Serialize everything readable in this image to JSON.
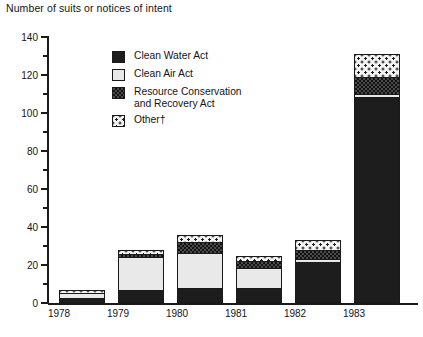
{
  "chart_data": {
    "type": "bar",
    "stacked": true,
    "title": "Number of suits or notices of intent",
    "xlabel": "",
    "ylabel": "Number of suits or notices of intent",
    "ylim": [
      0,
      140
    ],
    "ytick_step": 20,
    "yminor_step": 10,
    "grid": false,
    "legend_position": "inside-upper-left",
    "categories": [
      "1978",
      "1979",
      "1980",
      "1981",
      "1982",
      "1983"
    ],
    "yticks": [
      "0",
      "20",
      "40",
      "60",
      "80",
      "100",
      "120",
      "140"
    ],
    "series": [
      {
        "name": "Clean Water Act",
        "pattern": "solid-black",
        "values": [
          2,
          6,
          7,
          7,
          21,
          108
        ]
      },
      {
        "name": "Clean Air Act",
        "pattern": "light-stipple",
        "values": [
          3,
          18,
          19,
          11,
          2,
          2
        ]
      },
      {
        "name": "Resource Conservation\nand Recovery Act",
        "pattern": "dense-checker",
        "values": [
          0,
          1.5,
          6,
          4,
          5,
          9
        ]
      },
      {
        "name": "Other†",
        "pattern": "open-dots",
        "values": [
          2,
          2.5,
          4,
          3,
          5,
          12
        ]
      }
    ],
    "totals": [
      7,
      28,
      36,
      25,
      33,
      131
    ]
  },
  "legend": {
    "items": [
      {
        "label": "Clean Water Act",
        "swatch": "solid-black-swatch"
      },
      {
        "label": "Clean Air Act",
        "swatch": "light-stipple-swatch"
      },
      {
        "label": "Resource Conservation\nand Recovery Act",
        "swatch": "dense-checker-swatch"
      },
      {
        "label": "Other†",
        "swatch": "open-dots-swatch"
      }
    ]
  },
  "footnote": ""
}
